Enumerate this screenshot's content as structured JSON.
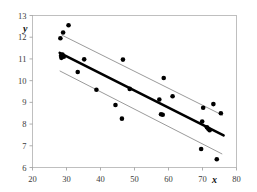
{
  "chart_data": {
    "type": "scatter",
    "title": "",
    "subtitle": "",
    "xlabel": "x",
    "ylabel": "y",
    "xlim": [
      20,
      80
    ],
    "ylim": [
      6,
      13
    ],
    "xticks": [
      20,
      30,
      40,
      50,
      60,
      70,
      80
    ],
    "yticks": [
      6,
      7,
      8,
      9,
      10,
      11,
      12,
      13
    ],
    "xticklabels": [
      "20",
      "30",
      "40",
      "50",
      "60",
      "70",
      "80"
    ],
    "yticklabels": [
      "6",
      "7",
      "8",
      "9",
      "10",
      "11",
      "12",
      "13"
    ],
    "grid": false,
    "legend": null,
    "frame": "box",
    "point_color": "#000000",
    "fit_line_color": "#000000",
    "band_line_color": "#8f8f8f",
    "points": [
      {
        "x": 28.2,
        "y": 11.95
      },
      {
        "x": 28.4,
        "y": 11.15
      },
      {
        "x": 28.5,
        "y": 11.05
      },
      {
        "x": 28.8,
        "y": 11.2
      },
      {
        "x": 29.0,
        "y": 12.22
      },
      {
        "x": 29.2,
        "y": 11.1
      },
      {
        "x": 30.6,
        "y": 12.55
      },
      {
        "x": 33.3,
        "y": 10.4
      },
      {
        "x": 35.2,
        "y": 10.98
      },
      {
        "x": 38.8,
        "y": 9.58
      },
      {
        "x": 44.4,
        "y": 8.88
      },
      {
        "x": 46.3,
        "y": 8.25
      },
      {
        "x": 46.6,
        "y": 10.97
      },
      {
        "x": 48.6,
        "y": 9.62
      },
      {
        "x": 57.3,
        "y": 9.13
      },
      {
        "x": 57.8,
        "y": 8.45
      },
      {
        "x": 58.3,
        "y": 8.43
      },
      {
        "x": 58.6,
        "y": 10.12
      },
      {
        "x": 61.2,
        "y": 9.28
      },
      {
        "x": 69.6,
        "y": 6.85
      },
      {
        "x": 69.9,
        "y": 8.12
      },
      {
        "x": 70.2,
        "y": 8.75
      },
      {
        "x": 71.3,
        "y": 7.85
      },
      {
        "x": 71.7,
        "y": 7.78
      },
      {
        "x": 72.1,
        "y": 7.72
      },
      {
        "x": 73.2,
        "y": 8.92
      },
      {
        "x": 74.2,
        "y": 6.38
      },
      {
        "x": 75.4,
        "y": 8.5
      }
    ],
    "fit_line": {
      "name": "regression-line",
      "x0": 28.0,
      "y0": 11.28,
      "x1": 76.2,
      "y1": 7.48
    },
    "upper_band": {
      "name": "upper-confidence-band",
      "x0": 28.6,
      "y0": 12.1,
      "x1": 76.0,
      "y1": 8.4
    },
    "lower_band": {
      "name": "lower-confidence-band",
      "x0": 28.0,
      "y0": 10.45,
      "x1": 75.8,
      "y1": 6.62
    }
  }
}
